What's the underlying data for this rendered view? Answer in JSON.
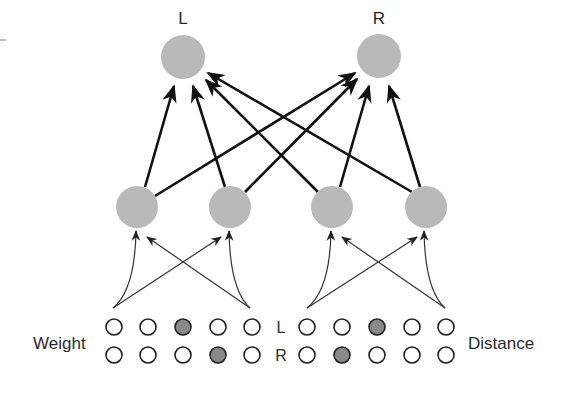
{
  "diagram": {
    "title": "",
    "output_labels": {
      "left": "L",
      "right": "R"
    },
    "input_labels": {
      "weight": "Weight",
      "distance": "Distance"
    },
    "row_labels": {
      "top": "L",
      "bottom": "R"
    },
    "colors": {
      "node_fill": "#b9b9b9",
      "filled_input": "#8a8a8a",
      "empty_input": "#ffffff",
      "stroke": "#222222",
      "edge": "#111111",
      "thin_edge": "#333333"
    },
    "weight_inputs": {
      "top_row": [
        0,
        0,
        1,
        0,
        0
      ],
      "bottom_row": [
        0,
        0,
        0,
        1,
        0
      ]
    },
    "distance_inputs": {
      "top_row": [
        0,
        0,
        1,
        0,
        0
      ],
      "bottom_row": [
        0,
        1,
        0,
        0,
        0
      ]
    },
    "layers": {
      "output_nodes": 2,
      "hidden_nodes": 4,
      "hidden_to_output": "fully connected",
      "input_to_hidden": "each input group feeds two hidden units with crossing connections"
    }
  }
}
